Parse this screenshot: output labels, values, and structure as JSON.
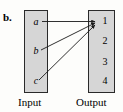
{
  "figure": {
    "part_label": "b.",
    "type": "mapping-diagram",
    "input": {
      "caption": "Input",
      "elements": [
        "a",
        "b",
        "c"
      ]
    },
    "output": {
      "caption": "Output",
      "elements": [
        "1",
        "2",
        "3",
        "4"
      ]
    },
    "mappings": [
      {
        "from": "a",
        "to": "1"
      },
      {
        "from": "b",
        "to": "1"
      },
      {
        "from": "c",
        "to": "1"
      }
    ],
    "colors": {
      "box_fill": "#d6d6d6",
      "box_border": "#2a2a2a",
      "arrow": "#1a1a1a",
      "text": "#000000",
      "background": "#fdfdfb"
    }
  }
}
